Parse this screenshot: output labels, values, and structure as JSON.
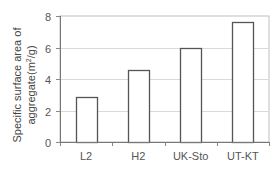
{
  "chart_data": {
    "type": "bar",
    "title": "",
    "xlabel": "",
    "ylabel": "Specific surface area of aggregate(m²/g)",
    "ylabel_lines": [
      "Specific surface area of",
      "aggregate(m²/g)"
    ],
    "categories": [
      "L2",
      "H2",
      "UK-Sto",
      "UT-KT"
    ],
    "values": [
      2.85,
      4.6,
      6.0,
      7.6
    ],
    "ylim": [
      0,
      8
    ],
    "yticks": [
      0,
      2,
      4,
      6,
      8
    ],
    "grid": true,
    "legend": null,
    "bar_fill": "#ffffff",
    "bar_stroke": "#555555",
    "grid_color": "#d9d9d9"
  }
}
